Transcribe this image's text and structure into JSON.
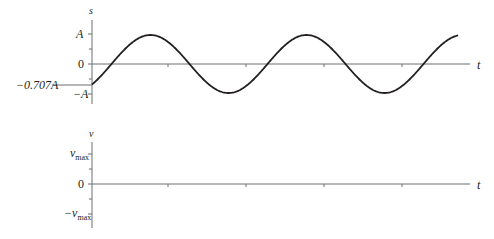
{
  "top_graph": {
    "y_axis_label": "s",
    "x_axis_label": "t",
    "tick_labels": {
      "pos": "A",
      "zero": "0",
      "neg": "−A",
      "initial": "−0.707A"
    },
    "curve": {
      "amplitude_label": "A",
      "initial_value": -0.707,
      "periods_shown": 2.6
    }
  },
  "bottom_graph": {
    "y_axis_label": "v",
    "x_axis_label": "t",
    "tick_labels": {
      "pos_main": "v",
      "pos_sub": "max",
      "zero": "0",
      "neg_main": "−v",
      "neg_sub": "max"
    }
  },
  "colors": {
    "curve": "#231f20",
    "axis": "#6d6e71"
  }
}
